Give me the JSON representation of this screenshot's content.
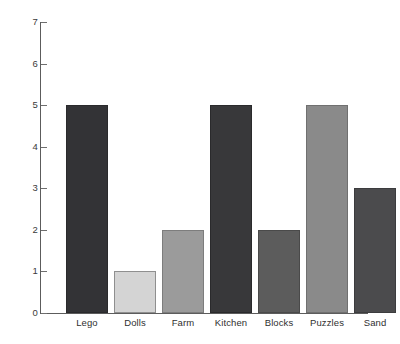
{
  "chart_data": {
    "type": "bar",
    "title": "",
    "subtitle": "",
    "xlabel": "",
    "ylabel": "",
    "categories": [
      "Lego",
      "Dolls",
      "Farm",
      "Kitchen",
      "Blocks",
      "Puzzles",
      "Sand"
    ],
    "values": [
      5,
      1,
      2,
      5,
      2,
      5,
      3
    ],
    "bar_colors": [
      "#333336",
      "#d4d4d4",
      "#9b9b9b",
      "#38383a",
      "#5c5c5c",
      "#8a8a8a",
      "#4b4b4d"
    ],
    "bar_border_colors": [
      "#2a2a2c",
      "#8f8f8f",
      "#7d7d7d",
      "#2a2a2c",
      "#4a4a4a",
      "#707070",
      "#3c3c3e"
    ],
    "ylim": [
      0,
      7
    ],
    "y_ticks": [
      0,
      1,
      2,
      3,
      4,
      5,
      6,
      7
    ],
    "y_tick_labels": [
      "0",
      "1",
      "2",
      "3",
      "4",
      "5",
      "6",
      "7"
    ],
    "grid": false,
    "legend": null,
    "legend_position": "none",
    "axis_color": "#5c5c5c",
    "background_color": "#ffffff"
  }
}
